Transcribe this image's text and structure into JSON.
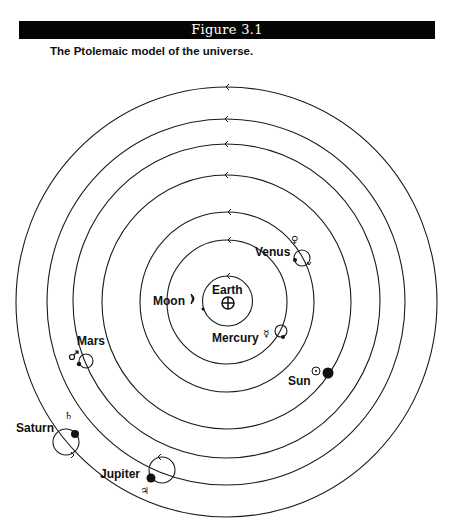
{
  "figure": {
    "number_label": "Figure 3.1",
    "caption": "The Ptolemaic model of the universe."
  },
  "diagram": {
    "center": {
      "x": 227,
      "y": 302
    },
    "orbits": [
      {
        "name": "moon-orbit",
        "rx": 25,
        "ry": 25
      },
      {
        "name": "mercury-orbit",
        "rx": 60,
        "ry": 62
      },
      {
        "name": "venus-orbit",
        "rx": 87,
        "ry": 90
      },
      {
        "name": "sun-orbit",
        "rx": 124,
        "ry": 127
      },
      {
        "name": "mars-orbit",
        "rx": 154,
        "ry": 157
      },
      {
        "name": "jupiter-orbit",
        "rx": 179,
        "ry": 183
      },
      {
        "name": "saturn-orbit",
        "rx": 210,
        "ry": 215
      }
    ],
    "direction_arrow": "counter-clockwise",
    "bodies": {
      "earth": {
        "label": "Earth",
        "symbol": "⊕"
      },
      "moon": {
        "label": "Moon",
        "symbol": "☽"
      },
      "mercury": {
        "label": "Mercury",
        "symbol": "☿"
      },
      "venus": {
        "label": "Venus",
        "symbol": "♀"
      },
      "sun": {
        "label": "Sun",
        "symbol": "☉"
      },
      "mars": {
        "label": "Mars",
        "symbol": "♂"
      },
      "jupiter": {
        "label": "Jupiter",
        "symbol": "♃"
      },
      "saturn": {
        "label": "Saturn",
        "symbol": "♄"
      }
    }
  }
}
